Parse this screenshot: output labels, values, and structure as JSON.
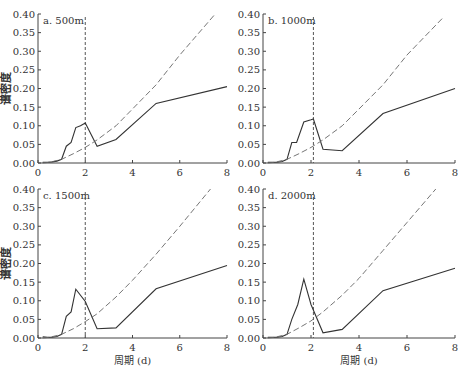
{
  "figure": {
    "ylabel": "谱密度",
    "xlabel": "周期 (d)",
    "xticks": [
      "0",
      "2",
      "4",
      "6",
      "8"
    ],
    "yticks": [
      "0.00",
      "0.05",
      "0.10",
      "0.15",
      "0.20",
      "0.25",
      "0.30",
      "0.35",
      "0.40"
    ],
    "colors": {
      "axis": "#444444",
      "solid": "#333333",
      "dashed": "#666666",
      "vline": "#555555"
    }
  },
  "chart_data": [
    {
      "type": "line",
      "title": "a. 500m",
      "xlabel": "",
      "ylabel": "谱密度",
      "xlim": [
        0,
        8
      ],
      "ylim": [
        0,
        0.4
      ],
      "vline_x": 2.0,
      "series": [
        {
          "name": "spectrum",
          "style": "solid",
          "x": [
            0.2,
            0.4,
            0.6,
            0.8,
            1.0,
            1.2,
            1.4,
            1.6,
            1.8,
            2.0,
            2.5,
            3.3,
            5.0,
            8.0
          ],
          "y": [
            0.002,
            0.002,
            0.003,
            0.005,
            0.01,
            0.045,
            0.055,
            0.095,
            0.1,
            0.107,
            0.045,
            0.063,
            0.16,
            0.205
          ]
        },
        {
          "name": "red-noise 95%",
          "style": "dashed",
          "x": [
            0.2,
            0.5,
            1.0,
            1.5,
            2.0,
            2.5,
            3.3,
            4.0,
            5.0,
            6.0,
            7.5
          ],
          "y": [
            0.0,
            0.002,
            0.01,
            0.025,
            0.042,
            0.062,
            0.1,
            0.145,
            0.21,
            0.29,
            0.4
          ]
        }
      ]
    },
    {
      "type": "line",
      "title": "b. 1000m",
      "xlabel": "",
      "ylabel": "",
      "xlim": [
        0,
        8
      ],
      "ylim": [
        0,
        0.4
      ],
      "vline_x": 2.1,
      "series": [
        {
          "name": "spectrum",
          "style": "solid",
          "x": [
            0.2,
            0.4,
            0.6,
            0.8,
            1.0,
            1.2,
            1.4,
            1.7,
            2.0,
            2.1,
            2.5,
            3.3,
            5.0,
            8.0
          ],
          "y": [
            0.002,
            0.002,
            0.002,
            0.004,
            0.01,
            0.055,
            0.055,
            0.11,
            0.116,
            0.118,
            0.037,
            0.033,
            0.133,
            0.2
          ]
        },
        {
          "name": "red-noise 95%",
          "style": "dashed",
          "x": [
            0.2,
            0.5,
            1.0,
            1.5,
            2.0,
            2.5,
            3.3,
            4.0,
            5.0,
            6.0,
            7.5
          ],
          "y": [
            0.0,
            0.002,
            0.01,
            0.025,
            0.042,
            0.062,
            0.1,
            0.145,
            0.21,
            0.29,
            0.39
          ]
        }
      ]
    },
    {
      "type": "line",
      "title": "c. 1500m",
      "xlabel": "周期 (d)",
      "ylabel": "谱密度",
      "xlim": [
        0,
        8
      ],
      "ylim": [
        0,
        0.4
      ],
      "vline_x": 2.0,
      "series": [
        {
          "name": "spectrum",
          "style": "solid",
          "x": [
            0.2,
            0.4,
            0.6,
            0.8,
            1.0,
            1.2,
            1.4,
            1.6,
            2.0,
            2.5,
            3.3,
            5.0,
            8.0
          ],
          "y": [
            0.003,
            0.002,
            0.002,
            0.004,
            0.01,
            0.058,
            0.07,
            0.131,
            0.098,
            0.025,
            0.027,
            0.132,
            0.195
          ]
        },
        {
          "name": "red-noise 95%",
          "style": "dashed",
          "x": [
            0.2,
            0.5,
            1.0,
            1.5,
            2.0,
            2.5,
            3.3,
            4.0,
            5.0,
            6.0,
            7.3
          ],
          "y": [
            0.0,
            0.002,
            0.01,
            0.025,
            0.044,
            0.065,
            0.11,
            0.155,
            0.225,
            0.3,
            0.4
          ]
        }
      ]
    },
    {
      "type": "line",
      "title": "d. 2000m",
      "xlabel": "周期 (d)",
      "ylabel": "",
      "xlim": [
        0,
        8
      ],
      "ylim": [
        0,
        0.4
      ],
      "vline_x": 2.1,
      "series": [
        {
          "name": "spectrum",
          "style": "solid",
          "x": [
            0.2,
            0.4,
            0.6,
            0.8,
            1.0,
            1.2,
            1.45,
            1.7,
            2.0,
            2.5,
            3.3,
            5.0,
            8.0
          ],
          "y": [
            0.002,
            0.002,
            0.002,
            0.004,
            0.01,
            0.05,
            0.09,
            0.158,
            0.09,
            0.014,
            0.023,
            0.127,
            0.187
          ]
        },
        {
          "name": "red-noise 95%",
          "style": "dashed",
          "x": [
            0.2,
            0.5,
            1.0,
            1.5,
            2.0,
            2.5,
            3.3,
            4.0,
            5.0,
            6.0,
            7.2
          ],
          "y": [
            0.0,
            0.002,
            0.01,
            0.027,
            0.046,
            0.07,
            0.115,
            0.16,
            0.235,
            0.31,
            0.4
          ]
        }
      ]
    }
  ]
}
